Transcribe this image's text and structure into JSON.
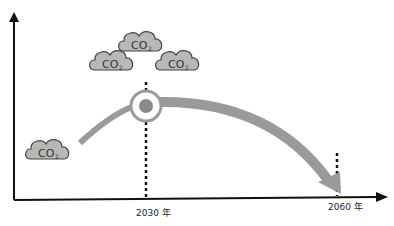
{
  "diagram": {
    "title": "",
    "clouds": [
      {
        "label": "CO",
        "subscript": "2"
      },
      {
        "label": "CO",
        "subscript": "2"
      },
      {
        "label": "CO",
        "subscript": "2"
      },
      {
        "label": "CO",
        "subscript": "2"
      }
    ],
    "x_axis": {
      "ticks": [
        {
          "label": "2030 年"
        },
        {
          "label": "2060 年"
        }
      ]
    },
    "peak_marker": "peak-circle",
    "colors": {
      "axis": "#111111",
      "curve": "#9a9a9a",
      "cloud_fill": "#b8b8b8",
      "cloud_stroke": "#444444",
      "marker_ring": "#9a9a9a",
      "marker_dot": "#8a8a8a"
    }
  }
}
